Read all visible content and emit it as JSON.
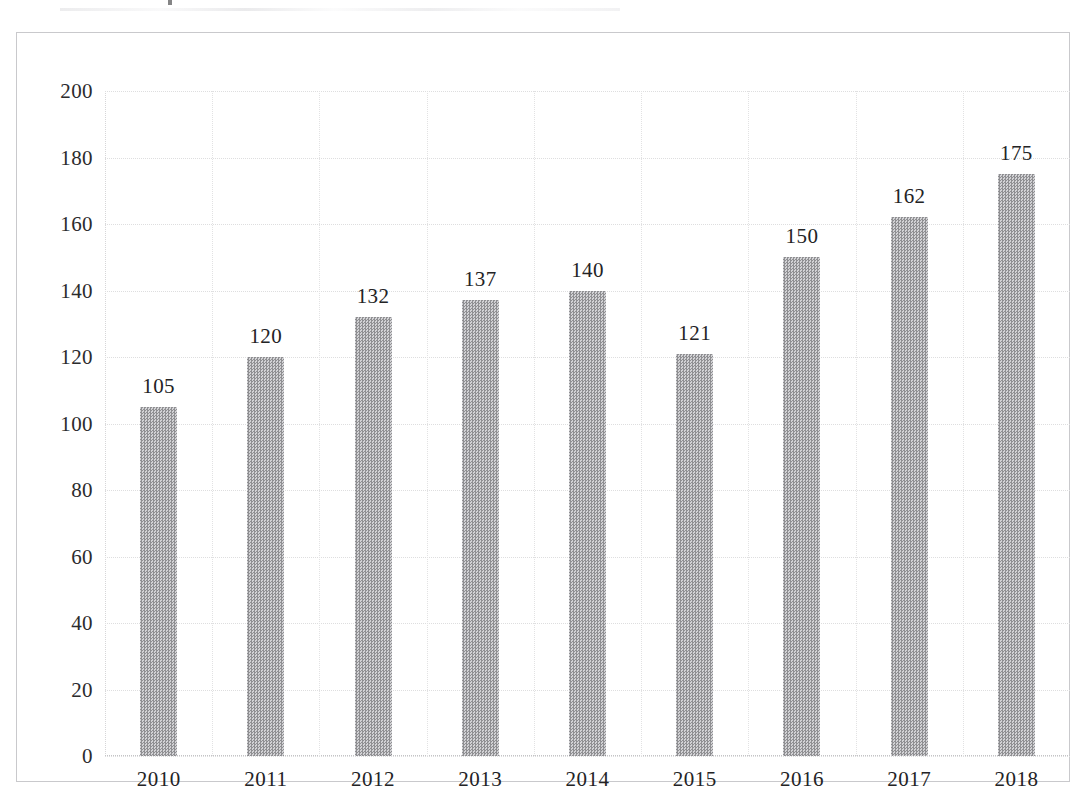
{
  "chart_data": {
    "type": "bar",
    "title": "",
    "xlabel": "",
    "ylabel": "",
    "categories": [
      "2010",
      "2011",
      "2012",
      "2013",
      "2014",
      "2015",
      "2016",
      "2017",
      "2018"
    ],
    "values": [
      105,
      120,
      132,
      137,
      140,
      121,
      150,
      162,
      175
    ],
    "data_labels": [
      "105",
      "120",
      "132",
      "137",
      "140",
      "121",
      "150",
      "162",
      "175"
    ],
    "ylim": [
      0,
      200
    ],
    "ytick_labels": [
      "0",
      "20",
      "40",
      "60",
      "80",
      "100",
      "120",
      "140",
      "160",
      "180",
      "200"
    ],
    "ytick_values": [
      0,
      20,
      40,
      60,
      80,
      100,
      120,
      140,
      160,
      180,
      200
    ],
    "grid": true,
    "grid_style": "dotted",
    "legend": false,
    "legend_position": "none",
    "bar_color": "#a5a5a7",
    "bar_pattern": "halftone-dither-gray",
    "text_color": "#232325",
    "grid_color": "#dededf",
    "frame_color": "#c9c9cc",
    "background_color": "#ffffff"
  }
}
